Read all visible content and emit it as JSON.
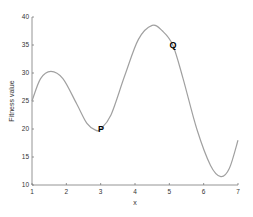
{
  "chart_data": {
    "type": "line",
    "title": "",
    "xlabel": "x",
    "ylabel": "Fitness value",
    "xlim": [
      1,
      7
    ],
    "ylim": [
      10,
      40
    ],
    "xticks": [
      1,
      2,
      3,
      4,
      5,
      6,
      7
    ],
    "yticks": [
      10,
      15,
      20,
      25,
      30,
      35,
      40
    ],
    "grid": false,
    "legend": null,
    "series": [
      {
        "name": "fitness curve",
        "color": "#a0a0a0",
        "x": [
          1.0,
          1.25,
          1.55,
          1.9,
          2.3,
          2.6,
          2.85,
          3.0,
          3.3,
          3.7,
          4.1,
          4.5,
          4.8,
          5.1,
          5.4,
          5.8,
          6.2,
          6.5,
          6.75,
          7.0
        ],
        "y": [
          25.0,
          29.0,
          30.3,
          29.0,
          24.5,
          21.0,
          19.8,
          20.0,
          22.5,
          29.5,
          36.0,
          38.5,
          37.5,
          35.0,
          29.0,
          20.0,
          13.5,
          11.5,
          13.0,
          18.0
        ]
      }
    ],
    "annotations": [
      {
        "label": "P",
        "x": 3.0,
        "y": 20.0
      },
      {
        "label": "Q",
        "x": 5.1,
        "y": 35.0
      }
    ]
  },
  "labels": {
    "xlabel": "x",
    "ylabel": "Fitness value",
    "xticks": [
      "1",
      "2",
      "3",
      "4",
      "5",
      "6",
      "7"
    ],
    "yticks": [
      "10",
      "15",
      "20",
      "25",
      "30",
      "35",
      "40"
    ],
    "point_p": "P",
    "point_q": "Q"
  }
}
